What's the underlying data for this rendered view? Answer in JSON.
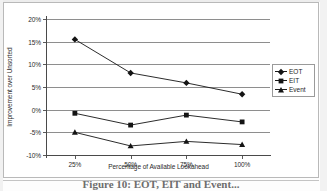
{
  "chart_data": {
    "type": "line",
    "title": "",
    "xlabel": "Percentage of Available Lookahead",
    "ylabel": "Improvement over Unsorted",
    "categories": [
      "25%",
      "50%",
      "75%",
      "100%"
    ],
    "x_tick_labels": [
      "25%",
      "50%",
      "75%",
      "100%"
    ],
    "y_tick_labels": [
      "20%",
      "15%",
      "10%",
      "5%",
      "0%",
      "-5%",
      "-10%"
    ],
    "y_tick_values": [
      20,
      15,
      10,
      5,
      0,
      -5,
      -10
    ],
    "ylim": [
      -10,
      20
    ],
    "y_step": 5,
    "grid": "horizontal",
    "legend_position": "right",
    "series": [
      {
        "name": "EOT",
        "marker": "diamond",
        "color": "#141414",
        "values": [
          15.5,
          8.1,
          5.9,
          3.4
        ]
      },
      {
        "name": "EIT",
        "marker": "square",
        "color": "#141414",
        "values": [
          -0.8,
          -3.4,
          -1.2,
          -2.7
        ]
      },
      {
        "name": "Event",
        "marker": "triangle",
        "color": "#141414",
        "values": [
          -5.0,
          -8.0,
          -7.0,
          -7.7
        ]
      }
    ]
  },
  "legend": {
    "items": [
      {
        "label": "EOT",
        "marker": "diamond"
      },
      {
        "label": "EIT",
        "marker": "square"
      },
      {
        "label": "Event",
        "marker": "triangle"
      }
    ]
  },
  "caption": {
    "text": "Figure 10: EOT, EIT and Event..."
  }
}
